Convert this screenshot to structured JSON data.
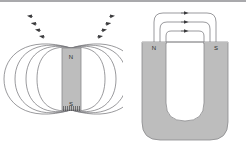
{
  "figure": {
    "background_color": "#ffffff",
    "top_rule_color": "#a9a9ac",
    "field_line_color": "#6e6e73",
    "arrow_color": "#3a3a3c",
    "magnet_fill": "#bdbdbd",
    "magnet_stroke": "#8a8a8d",
    "hatch_color": "#4a4a4c"
  },
  "panels": [
    {
      "id": "bar-magnet",
      "name": "Bar magnet field diagram",
      "magnet_shape": "rectangular bar",
      "poles": [
        {
          "label": "N",
          "position": "top",
          "x": 71,
          "y": 57
        },
        {
          "label": "S",
          "position": "bottom",
          "x": 71,
          "y": 104
        }
      ],
      "magnet_rect": {
        "x": 62,
        "y": 48,
        "width": 19,
        "height": 62
      },
      "field_loop_count_per_side": 4,
      "field_loops": [
        {
          "side": "left",
          "rx": 17,
          "ry": 42,
          "cx": 54,
          "cy": 79
        },
        {
          "side": "left",
          "rx": 24,
          "ry": 50,
          "cx": 49,
          "cy": 79
        },
        {
          "side": "left",
          "rx": 31,
          "ry": 57,
          "cx": 44,
          "cy": 79
        },
        {
          "side": "left",
          "rx": 38,
          "ry": 64,
          "cx": 39,
          "cy": 79
        },
        {
          "side": "right",
          "rx": 17,
          "ry": 42,
          "cx": 89,
          "cy": 79
        },
        {
          "side": "right",
          "rx": 24,
          "ry": 50,
          "cx": 94,
          "cy": 79
        },
        {
          "side": "right",
          "rx": 31,
          "ry": 57,
          "cx": 99,
          "cy": 79
        },
        {
          "side": "right",
          "rx": 38,
          "ry": 64,
          "cx": 104,
          "cy": 79
        }
      ],
      "arrow_count": 8,
      "arrow_direction": "out of north pole, around, into south pole"
    },
    {
      "id": "horseshoe-magnet",
      "name": "Horseshoe (U-shaped) magnet field diagram",
      "magnet_shape": "U-shaped / horseshoe",
      "poles": [
        {
          "label": "N",
          "position": "left-arm-top",
          "x": 45,
          "y": 47
        },
        {
          "label": "S",
          "position": "right-arm-top",
          "x": 79,
          "y": 47
        }
      ],
      "magnet_outer": {
        "x": 19,
        "y": 42,
        "width": 86,
        "height": 98,
        "corner_radius": 18
      },
      "magnet_slot": {
        "x": 43,
        "y": 42,
        "width": 38,
        "height": 79,
        "corner_radius": 18
      },
      "field_arc_count": 3,
      "field_arcs": [
        {
          "index": 1,
          "span_half_width": 40,
          "apex_y": 13
        },
        {
          "index": 2,
          "span_half_width": 30,
          "apex_y": 22
        },
        {
          "index": 3,
          "span_half_width": 19,
          "apex_y": 31
        }
      ],
      "arrow_count": 3,
      "arrow_direction": "left to right, north to south"
    }
  ]
}
